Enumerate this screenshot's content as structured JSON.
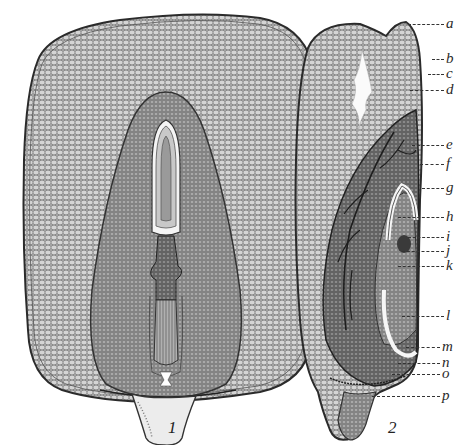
{
  "figure": {
    "panels": [
      {
        "number": "1",
        "view": "longitudinal section, broad face"
      },
      {
        "number": "2",
        "view": "longitudinal section, narrow face"
      }
    ],
    "labels": [
      {
        "letter": "a",
        "y": 24,
        "x_end": 400
      },
      {
        "letter": "b",
        "y": 59,
        "x_end": 430
      },
      {
        "letter": "c",
        "y": 74,
        "x_end": 426
      },
      {
        "letter": "d",
        "y": 90,
        "x_end": 410
      },
      {
        "letter": "e",
        "y": 145,
        "x_end": 412
      },
      {
        "letter": "f",
        "y": 164,
        "x_end": 420
      },
      {
        "letter": "g",
        "y": 188,
        "x_end": 422
      },
      {
        "letter": "h",
        "y": 217,
        "x_end": 398
      },
      {
        "letter": "i",
        "y": 237,
        "x_end": 408
      },
      {
        "letter": "j",
        "y": 251,
        "x_end": 402
      },
      {
        "letter": "k",
        "y": 266,
        "x_end": 398
      },
      {
        "letter": "l",
        "y": 316,
        "x_end": 402
      },
      {
        "letter": "m",
        "y": 347,
        "x_end": 406
      },
      {
        "letter": "n",
        "y": 363,
        "x_end": 398
      },
      {
        "letter": "o",
        "y": 374,
        "x_end": 392
      },
      {
        "letter": "p",
        "y": 396,
        "x_end": 380
      }
    ],
    "colors": {
      "ink": "#2b2b2b",
      "tissue_fill": "#bdbdbd",
      "dark_tissue": "#7a7a7a",
      "paper": "#ffffff"
    }
  }
}
